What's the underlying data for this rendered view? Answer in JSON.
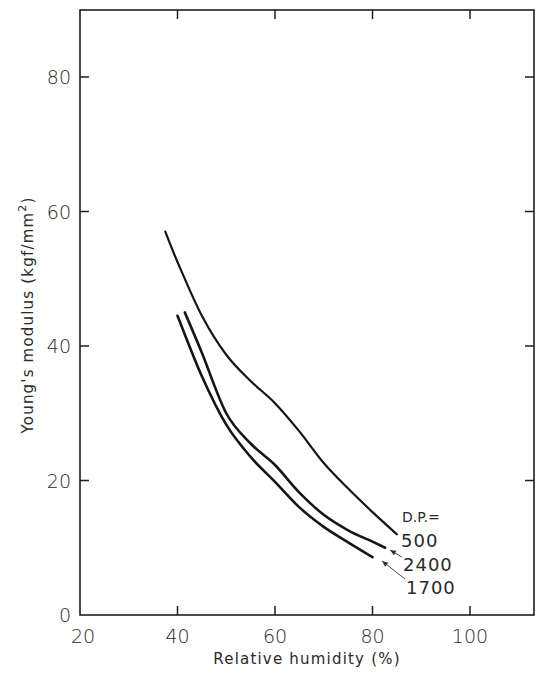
{
  "chart_data": {
    "type": "line",
    "title": "",
    "xlabel": "Relative humidity (%)",
    "ylabel": "Young's modulus (kgf/mm²)",
    "ylabel_main": "Young's modulus (kgf/mm",
    "ylabel_sup": "2",
    "ylabel_close": ")",
    "xlim": [
      20,
      114
    ],
    "ylim": [
      0,
      90
    ],
    "xticks": [
      20,
      40,
      60,
      80,
      100
    ],
    "yticks": [
      0,
      20,
      40,
      60,
      80
    ],
    "grid": false,
    "legend_title": "D.P.=",
    "legend_position": "inline labels at curve ends, lower right",
    "series": [
      {
        "name": "500",
        "x": [
          37.5,
          40,
          45,
          50,
          55,
          60,
          65,
          70,
          75,
          80,
          85
        ],
        "y": [
          57,
          52.5,
          44.5,
          38.7,
          34.8,
          31.5,
          27.3,
          22.6,
          18.8,
          15.3,
          12
        ]
      },
      {
        "name": "2400",
        "x": [
          41.5,
          45,
          50,
          55,
          60,
          65,
          70,
          75,
          80,
          82.6
        ],
        "y": [
          45,
          39,
          30,
          25.5,
          22.3,
          18.2,
          14.9,
          12.6,
          10.9,
          10
        ]
      },
      {
        "name": "1700",
        "x": [
          40,
          45,
          50,
          55,
          60,
          65,
          70,
          75,
          80
        ],
        "y": [
          44.5,
          35.5,
          28.3,
          23.5,
          19.8,
          16,
          13.1,
          10.8,
          8.6
        ]
      }
    ],
    "series_labels": [
      "500",
      "2400",
      "1700"
    ]
  }
}
